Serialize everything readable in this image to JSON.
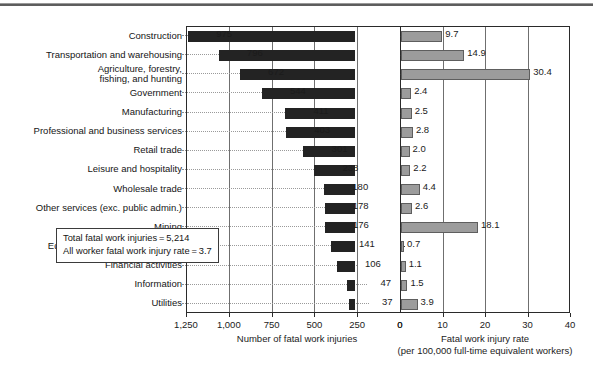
{
  "figure": {
    "annotation": {
      "line1": "Total fatal work injuries = 5,214",
      "line2": "All worker fatal work injury rate = 3.7"
    },
    "left_axis": {
      "title": "Number of fatal work injuries",
      "ticks": [
        "1,250",
        "1,000",
        "750",
        "500",
        "250",
        "0"
      ]
    },
    "right_axis": {
      "title_line1": "Fatal work injury rate",
      "title_line2": "(per 100,000 full-time equivalent workers)",
      "ticks": [
        "0",
        "10",
        "20",
        "30",
        "40"
      ]
    }
  },
  "chart_data": {
    "type": "bar",
    "orientation": "horizontal",
    "layout": "bidirectional-paired",
    "title": "",
    "categories": [
      "Construction",
      "Transportation and warehousing",
      "Agriculture, forestry,\nfishing, and hunting",
      "Government",
      "Manufacturing",
      "Professional and business services",
      "Retail trade",
      "Leisure and hospitality",
      "Wholesale trade",
      "Other services (exc. public admin.)",
      "Mining",
      "Educational and health services",
      "Financial activities",
      "Information",
      "Utilities"
    ],
    "series": [
      {
        "name": "Number of fatal work injuries",
        "side": "left",
        "color": "#232323",
        "axis_range": [
          0,
          1250
        ],
        "axis_reversed": true,
        "values": [
          975,
          796,
          672,
          544,
          411,
          403,
          301,
          238,
          180,
          178,
          176,
          141,
          106,
          47,
          37
        ],
        "labels": [
          "975",
          "796",
          "672",
          "544",
          "411",
          "403",
          "301",
          "238",
          "180",
          "178",
          "176",
          "141",
          "106",
          "47",
          "37"
        ]
      },
      {
        "name": "Fatal work injury rate",
        "side": "right",
        "color": "#9c9c9c",
        "axis_range": [
          0,
          40
        ],
        "axis_reversed": false,
        "values": [
          9.7,
          14.9,
          30.4,
          2.4,
          2.5,
          2.8,
          2.0,
          2.2,
          4.4,
          2.6,
          18.1,
          0.7,
          1.1,
          1.5,
          3.9
        ],
        "labels": [
          "9.7",
          "14.9",
          "30.4",
          "2.4",
          "2.5",
          "2.8",
          "2.0",
          "2.2",
          "4.4",
          "2.6",
          "18.1",
          "0.7",
          "1.1",
          "1.5",
          "3.9"
        ]
      }
    ],
    "annotations": [
      "Total fatal work injuries = 5,214",
      "All worker fatal work injury rate = 3.7"
    ],
    "grid": {
      "vertical": true,
      "horizontal_dotted_leaders": true
    },
    "legend": null
  }
}
